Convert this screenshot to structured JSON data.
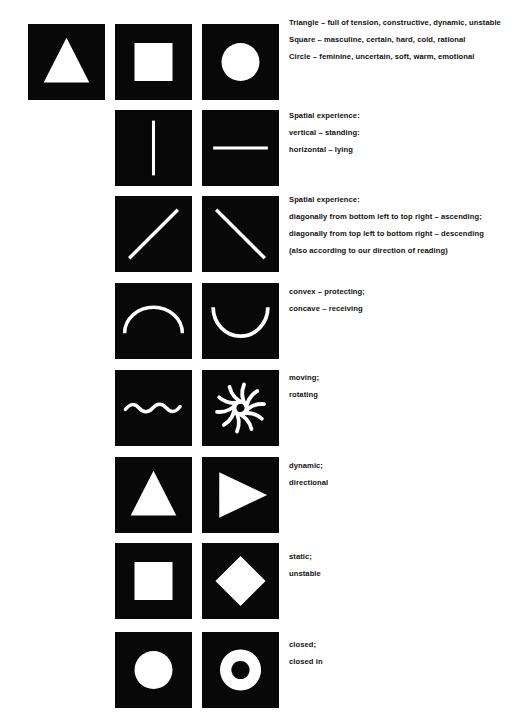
{
  "page": {
    "background_color": "#ffffff",
    "tile_color": "#080808",
    "figure_color": "#ffffff",
    "text_color": "#111111",
    "width": 530,
    "height": 722
  },
  "rows": [
    {
      "id": "row-basic-shapes",
      "tiles": [
        {
          "name": "triangle-tile",
          "figure": "triangle"
        },
        {
          "name": "square-tile",
          "figure": "square"
        },
        {
          "name": "circle-tile",
          "figure": "circle"
        }
      ],
      "caption_lines": [
        "Triangle – full of tension, constructive, dynamic, unstable",
        "Square – masculine, certain, hard, cold, rational",
        "Circle – feminine, uncertain, soft, warm, emotional"
      ]
    },
    {
      "id": "row-vertical-horizontal",
      "tiles": [
        {
          "name": "vertical-line-tile",
          "figure": "vertical-line"
        },
        {
          "name": "horizontal-line-tile",
          "figure": "horizontal-line"
        }
      ],
      "caption_lines": [
        "Spatial experience:",
        "vertical – standing:",
        "horizontal – lying"
      ]
    },
    {
      "id": "row-diagonals",
      "tiles": [
        {
          "name": "ascending-diagonal-tile",
          "figure": "diagonal-ascending"
        },
        {
          "name": "descending-diagonal-tile",
          "figure": "diagonal-descending"
        }
      ],
      "caption_lines": [
        "Spatial experience:",
        "diagonally from bottom left to top right – ascending;",
        "diagonally from top left to bottom right – descending",
        "(also according to our direction of reading)"
      ]
    },
    {
      "id": "row-convex-concave",
      "tiles": [
        {
          "name": "convex-arc-tile",
          "figure": "arc-convex"
        },
        {
          "name": "concave-arc-tile",
          "figure": "arc-concave"
        }
      ],
      "caption_lines": [
        "convex – protecting;",
        "concave – receiving"
      ]
    },
    {
      "id": "row-moving-rotating",
      "tiles": [
        {
          "name": "wave-tile",
          "figure": "wave"
        },
        {
          "name": "spiral-tile",
          "figure": "pinwheel"
        }
      ],
      "caption_lines": [
        "moving;",
        "rotating"
      ]
    },
    {
      "id": "row-dynamic-directional",
      "tiles": [
        {
          "name": "upward-triangle-tile",
          "figure": "triangle"
        },
        {
          "name": "rightward-triangle-tile",
          "figure": "triangle-right"
        }
      ],
      "caption_lines": [
        "dynamic;",
        "directional"
      ]
    },
    {
      "id": "row-static-unstable",
      "tiles": [
        {
          "name": "square-static-tile",
          "figure": "square"
        },
        {
          "name": "diamond-tile",
          "figure": "diamond"
        }
      ],
      "caption_lines": [
        "static;",
        "unstable"
      ]
    },
    {
      "id": "row-closed-closed-in",
      "tiles": [
        {
          "name": "disc-tile",
          "figure": "circle"
        },
        {
          "name": "ring-tile",
          "figure": "ring"
        }
      ],
      "caption_lines": [
        "closed;",
        "closed in"
      ]
    }
  ]
}
